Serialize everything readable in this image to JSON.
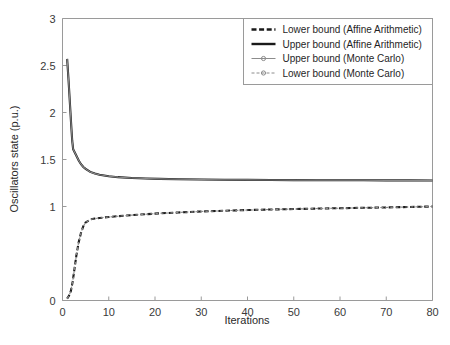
{
  "chart_data": {
    "type": "line",
    "title": "",
    "xlabel": "Iterations",
    "ylabel": "Oscillators state (p.u.)",
    "xlim": [
      0,
      80
    ],
    "ylim": [
      0,
      3
    ],
    "xticks": [
      0,
      10,
      20,
      30,
      40,
      50,
      60,
      70,
      80
    ],
    "yticks": [
      0,
      1,
      1.5,
      2,
      2.5,
      3
    ],
    "ytick_labels": [
      "0",
      "1",
      "1.5",
      "2",
      "2.5",
      "3"
    ],
    "grid": false,
    "legend_position": "top-right",
    "series": [
      {
        "name": "Lower bound (Affine Arithmetic)",
        "style": "dashed",
        "color": "#1a1a1a",
        "width": 2.1,
        "x": [
          1,
          1.4,
          1.8,
          2.2,
          2.6,
          3,
          3.5,
          4,
          4.5,
          5,
          6,
          7,
          8,
          10,
          12,
          15,
          18,
          21,
          25,
          30,
          35,
          40,
          45,
          50,
          55,
          60,
          65,
          70,
          75,
          80
        ],
        "y": [
          0.02,
          0.05,
          0.1,
          0.2,
          0.34,
          0.48,
          0.62,
          0.72,
          0.79,
          0.83,
          0.862,
          0.872,
          0.878,
          0.888,
          0.897,
          0.908,
          0.918,
          0.927,
          0.936,
          0.947,
          0.955,
          0.962,
          0.968,
          0.973,
          0.978,
          0.982,
          0.986,
          0.99,
          0.995,
          1.0
        ]
      },
      {
        "name": "Upper bound (Affine Arithmetic)",
        "style": "solid",
        "color": "#1a1a1a",
        "width": 2.1,
        "x": [
          1,
          1.3,
          1.6,
          1.9,
          2.1,
          2.3,
          2.6,
          3,
          3.5,
          4,
          4.5,
          5,
          6,
          7,
          8,
          10,
          12,
          15,
          18,
          21,
          25,
          30,
          35,
          40,
          45,
          50,
          55,
          60,
          65,
          70,
          75,
          80
        ],
        "y": [
          2.57,
          2.35,
          2.1,
          1.85,
          1.7,
          1.61,
          1.58,
          1.54,
          1.49,
          1.45,
          1.42,
          1.4,
          1.368,
          1.35,
          1.338,
          1.322,
          1.312,
          1.303,
          1.298,
          1.294,
          1.29,
          1.287,
          1.285,
          1.283,
          1.282,
          1.281,
          1.28,
          1.279,
          1.279,
          1.278,
          1.278,
          1.277
        ]
      },
      {
        "name": "Upper bound (Monte Carlo)",
        "style": "solid-marker",
        "color": "#8c8c8c",
        "width": 1.1,
        "x": [
          1,
          1.3,
          1.6,
          1.9,
          2.1,
          2.3,
          2.6,
          3,
          3.5,
          4,
          4.5,
          5,
          6,
          7,
          8,
          10,
          12,
          15,
          18,
          21,
          25,
          30,
          35,
          40,
          45,
          50,
          55,
          60,
          65,
          70,
          75,
          80
        ],
        "y": [
          2.57,
          2.35,
          2.1,
          1.85,
          1.7,
          1.61,
          1.58,
          1.54,
          1.49,
          1.45,
          1.42,
          1.4,
          1.368,
          1.35,
          1.338,
          1.322,
          1.312,
          1.303,
          1.298,
          1.294,
          1.29,
          1.287,
          1.285,
          1.283,
          1.282,
          1.281,
          1.28,
          1.279,
          1.279,
          1.278,
          1.278,
          1.277
        ]
      },
      {
        "name": "Lower bound (Monte Carlo)",
        "style": "dashed-marker",
        "color": "#8c8c8c",
        "width": 1.1,
        "x": [
          1,
          1.4,
          1.8,
          2.2,
          2.6,
          3,
          3.5,
          4,
          4.5,
          5,
          6,
          7,
          8,
          10,
          12,
          15,
          18,
          21,
          25,
          30,
          35,
          40,
          45,
          50,
          55,
          60,
          65,
          70,
          75,
          80
        ],
        "y": [
          0.02,
          0.05,
          0.1,
          0.2,
          0.34,
          0.48,
          0.62,
          0.72,
          0.79,
          0.83,
          0.862,
          0.872,
          0.878,
          0.888,
          0.897,
          0.908,
          0.918,
          0.927,
          0.936,
          0.947,
          0.955,
          0.962,
          0.968,
          0.973,
          0.978,
          0.982,
          0.986,
          0.99,
          0.995,
          1.0
        ]
      }
    ],
    "legend": [
      {
        "label": "Lower bound (Affine Arithmetic)",
        "style": "dashed",
        "color": "#1a1a1a"
      },
      {
        "label": "Upper bound (Affine Arithmetic)",
        "style": "solid",
        "color": "#1a1a1a"
      },
      {
        "label": "Upper bound (Monte Carlo)",
        "style": "solid-marker",
        "color": "#8c8c8c"
      },
      {
        "label": "Lower bound (Monte Carlo)",
        "style": "dashed-marker",
        "color": "#8c8c8c"
      }
    ]
  }
}
